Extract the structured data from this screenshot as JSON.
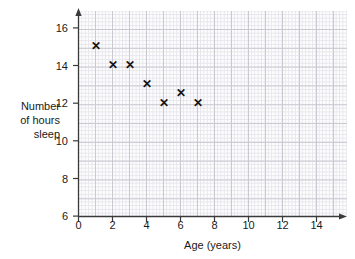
{
  "chart_data": {
    "type": "scatter",
    "title": "",
    "xlabel": "Age (years)",
    "ylabel": "Number\nof hours\nsleep",
    "ylabel_lines": [
      "Number",
      "of hours",
      "sleep"
    ],
    "xlim": [
      0,
      15.8
    ],
    "ylim": [
      6,
      16.9
    ],
    "xticks": [
      0,
      2,
      4,
      6,
      8,
      10,
      12,
      14
    ],
    "yticks": [
      6,
      8,
      10,
      12,
      14,
      16
    ],
    "xtick_labels": [
      "0",
      "2",
      "4",
      "6",
      "8",
      "10",
      "12",
      "14"
    ],
    "ytick_labels": [
      "6",
      "8",
      "10",
      "12",
      "14",
      "16"
    ],
    "minor_grid": true,
    "major_grid": true,
    "grid": true,
    "legend": null,
    "marker": "x",
    "marker_color": "#141414",
    "grid_major_color": "#c9c9d2",
    "grid_minor_color": "#e6e6ec",
    "axis_color": "#3a3a3a",
    "background_color": "#ffffff",
    "plot_background_color": "#fdfdfd",
    "x": [
      1,
      2,
      3,
      4,
      5,
      6,
      7
    ],
    "y": [
      15,
      14,
      14,
      13,
      12,
      12.5,
      12
    ],
    "points": [
      {
        "x": 1,
        "y": 15
      },
      {
        "x": 2,
        "y": 14
      },
      {
        "x": 3,
        "y": 14
      },
      {
        "x": 4,
        "y": 13
      },
      {
        "x": 5,
        "y": 12
      },
      {
        "x": 6,
        "y": 12.5
      },
      {
        "x": 7,
        "y": 12
      }
    ]
  }
}
